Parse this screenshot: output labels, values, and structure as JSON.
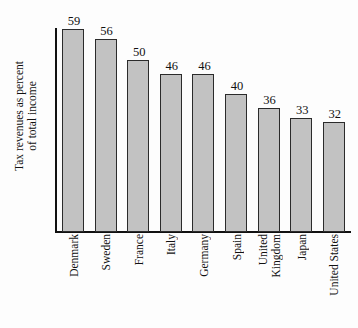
{
  "chart_data": {
    "type": "bar",
    "title": "",
    "subtitle": "",
    "xlabel": "",
    "ylabel": "Tax revenues as percent of total income",
    "ylabel_lines": [
      "Tax revenues as percent",
      "of total income"
    ],
    "categories": [
      "Denmark",
      "Sweden",
      "France",
      "Italy",
      "Germany",
      "Spain",
      "United Kingdom",
      "Japan",
      "United States"
    ],
    "category_lines": [
      [
        "Denmark"
      ],
      [
        "Sweden"
      ],
      [
        "France"
      ],
      [
        "Italy"
      ],
      [
        "Germany"
      ],
      [
        "Spain"
      ],
      [
        "United",
        "Kingdom"
      ],
      [
        "Japan"
      ],
      [
        "United States"
      ]
    ],
    "values": [
      59,
      56,
      50,
      46,
      46,
      40,
      36,
      33,
      32
    ],
    "value_labels": [
      "59",
      "56",
      "50",
      "46",
      "46",
      "40",
      "36",
      "33",
      "32"
    ],
    "ylim": [
      0,
      59
    ],
    "y_axis_ticks": [],
    "grid": false,
    "legend": false,
    "legend_position": "none",
    "bar_fill_color": "#c2c2c2",
    "bar_border_color": "#2b2b2b",
    "axis_color": "#111111",
    "background_color": "#fdfdfd",
    "text_color": "#111111"
  }
}
